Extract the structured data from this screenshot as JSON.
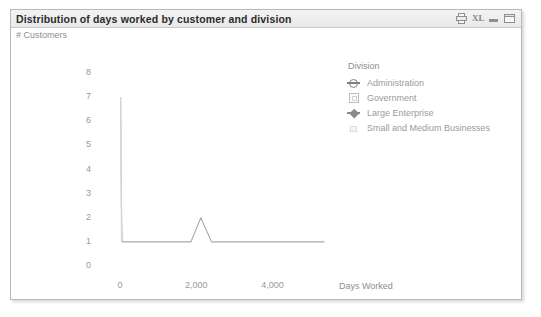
{
  "window": {
    "title": "Distribution of days worked by customer and division",
    "buttons": [
      {
        "name": "print-icon",
        "label": "Print"
      },
      {
        "name": "excel-icon",
        "label": "XL"
      },
      {
        "name": "minimize-icon",
        "label": "Minimize"
      },
      {
        "name": "maximize-icon",
        "label": "Maximize"
      }
    ]
  },
  "legend": {
    "title": "Division",
    "position": "top-right",
    "items": [
      {
        "label": "Administration",
        "marker": "circle-bar-marker",
        "color": "#808080"
      },
      {
        "label": "Government",
        "marker": "square-marker",
        "color": "#bdbdbd"
      },
      {
        "label": "Large Enterprise",
        "marker": "diamond-bar-marker",
        "color": "#8a8a8a"
      },
      {
        "label": "Small and Medium Businesses",
        "marker": "faint-square-marker",
        "color": "#e2e2e2"
      }
    ]
  },
  "chart_data": {
    "type": "line",
    "title": "Distribution of days worked by customer and division",
    "xlabel": "Days Worked",
    "ylabel": "# Customers",
    "xlim": [
      -260,
      5400
    ],
    "ylim": [
      0,
      8
    ],
    "xticks": [
      0,
      2000,
      4000
    ],
    "xticklabels": [
      "0",
      "2,000",
      "4,000"
    ],
    "yticks": [
      0,
      1,
      2,
      3,
      4,
      5,
      6,
      7,
      8
    ],
    "yticklabels": [
      "0",
      "1",
      "2",
      "3",
      "4",
      "5",
      "6",
      "7",
      "8"
    ],
    "grid": false,
    "legend": "Division",
    "series": [
      {
        "name": "Administration",
        "color": "#a8a8a8",
        "x": [
          60,
          120,
          200,
          300,
          420,
          560,
          700,
          860,
          1020,
          1200,
          1400,
          1620,
          1860,
          2120,
          2400,
          2700,
          3020,
          3360,
          3720,
          4100,
          4500,
          4920,
          5360
        ],
        "y": [
          1,
          1,
          1,
          1,
          1,
          1,
          1,
          1,
          1,
          1,
          1,
          1,
          1,
          2,
          1,
          1,
          1,
          1,
          1,
          1,
          1,
          1,
          1
        ]
      },
      {
        "name": "Government",
        "color": "#d6d6d6",
        "x": [
          20,
          30,
          40
        ],
        "y": [
          7,
          4,
          1
        ]
      },
      {
        "name": "Large Enterprise",
        "color": "#c4c4c4",
        "x": [
          20,
          35,
          55
        ],
        "y": [
          7,
          3,
          1
        ]
      },
      {
        "name": "Small and Medium Businesses",
        "color": "#ececec",
        "x": [
          25,
          45,
          90
        ],
        "y": [
          6,
          2,
          1
        ]
      }
    ]
  }
}
